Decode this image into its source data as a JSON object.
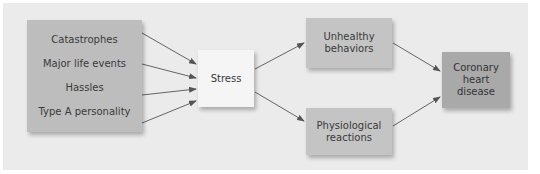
{
  "diagram": {
    "sources": [
      "Catastrophes",
      "Major life events",
      "Hassles",
      "Type A personality"
    ],
    "stress": "Stress",
    "mediators": [
      "Unhealthy behaviors",
      "Physiological reactions"
    ],
    "outcome": "Coronary heart disease",
    "edges": [
      {
        "from": "Catastrophes",
        "to": "Stress"
      },
      {
        "from": "Major life events",
        "to": "Stress"
      },
      {
        "from": "Hassles",
        "to": "Stress"
      },
      {
        "from": "Type A personality",
        "to": "Stress"
      },
      {
        "from": "Stress",
        "to": "Unhealthy behaviors"
      },
      {
        "from": "Stress",
        "to": "Physiological reactions"
      },
      {
        "from": "Unhealthy behaviors",
        "to": "Coronary heart disease"
      },
      {
        "from": "Physiological reactions",
        "to": "Coronary heart disease"
      }
    ]
  },
  "colors": {
    "panel": "#ebebeb",
    "sources_box": "#bdbdbd",
    "stress_box": "#f5f5f5",
    "mediator_box": "#c4c4c4",
    "outcome_box": "#a9a9a9",
    "arrow": "#555555"
  }
}
